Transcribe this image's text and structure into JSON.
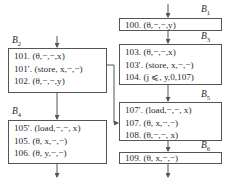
{
  "diagram": {
    "type": "control-flow-graph",
    "blocks": [
      {
        "id": "B1",
        "label_main": "B",
        "label_sub": "1",
        "lines": [
          "100. (θ,−,−,y)"
        ]
      },
      {
        "id": "B2",
        "label_main": "B",
        "label_sub": "2",
        "lines": [
          "101. (θ,−,−,x)",
          "101′. (store, x,−,−)",
          "102. (θ,−,−,y)"
        ]
      },
      {
        "id": "B3",
        "label_main": "B",
        "label_sub": "3",
        "lines": [
          "103. (θ,−,−,x)",
          "103′. (store, x,−,−)",
          "104. (j ⩽, y,0,107)"
        ]
      },
      {
        "id": "B4",
        "label_main": "B",
        "label_sub": "4",
        "lines": [
          "105′. (load,−,−, x)",
          "105. (θ, x,−,−)",
          "106. (θ, y,−,−)"
        ]
      },
      {
        "id": "B5",
        "label_main": "B",
        "label_sub": "5",
        "lines": [
          "107′. (load,−,−, x)",
          "107. (θ, x,−,−)",
          "108. (θ,−,−, x)"
        ]
      },
      {
        "id": "B6",
        "label_main": "B",
        "label_sub": "6",
        "lines": [
          "109. (θ, x,−,−)"
        ]
      }
    ],
    "edges": [
      {
        "from": "entry",
        "to": "B1"
      },
      {
        "from": "B1",
        "to": "B3"
      },
      {
        "from": "B3",
        "to": "B5"
      },
      {
        "from": "B5",
        "to": "B6"
      },
      {
        "from": "B6",
        "to": "exit"
      },
      {
        "from": "entry",
        "to": "B2"
      },
      {
        "from": "B2",
        "to": "B4"
      },
      {
        "from": "B2",
        "to": "B5"
      },
      {
        "from": "B4",
        "to": "exit"
      }
    ],
    "colors": {
      "stroke": "#555555",
      "text": "#2a2a2a",
      "background": "#ffffff"
    }
  }
}
